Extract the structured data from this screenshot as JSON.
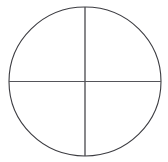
{
  "canvas": {
    "width": 168,
    "height": 162,
    "background_color": "#ffffff",
    "title": "Circle with Crosshair Diameters"
  },
  "figure": {
    "name": "circle-crosshair-diagram",
    "description": "Circle divided into four quadrants by a vertical and a horizontal diameter",
    "stroke_color": "#3c3c41",
    "stroke_width": 1.1,
    "fill": "none"
  },
  "chart_data": {
    "type": "diagram",
    "title": "",
    "shapes": [
      {
        "id": "circle-outline",
        "kind": "circle",
        "center_x": 85,
        "center_y": 81.5,
        "radius_x": 76,
        "radius_y": 74.5,
        "stroke": "#3c3c41",
        "stroke_width": 1.1,
        "fill": "none"
      },
      {
        "id": "vertical-diameter",
        "kind": "line",
        "x1": 85,
        "y1": 7,
        "x2": 85,
        "y2": 156,
        "stroke": "#47474c",
        "stroke_width": 1.3
      },
      {
        "id": "horizontal-diameter",
        "kind": "line",
        "x1": 9,
        "y1": 81.5,
        "x2": 161,
        "y2": 81.5,
        "stroke": "#55555a",
        "stroke_width": 1.1
      }
    ],
    "labels": [],
    "annotations": []
  }
}
